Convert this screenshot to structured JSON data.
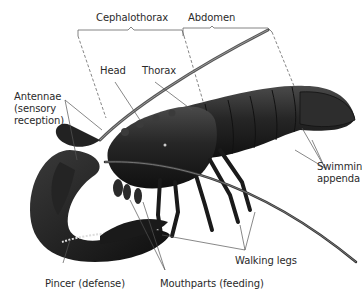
{
  "diagram": {
    "region_labels": {
      "cephalothorax": "Cephalothorax",
      "abdomen": "Abdomen"
    },
    "part_labels": {
      "head": "Head",
      "thorax": "Thorax",
      "antennae_line1": "Antennae",
      "antennae_line2": "(sensory",
      "antennae_line3": "reception)",
      "swimming_line1": "Swimmin",
      "swimming_line2": "appenda",
      "walking_legs": "Walking legs",
      "pincer": "Pincer (defense)",
      "mouthparts": "Mouthparts (feeding)"
    },
    "colors": {
      "background": "#ffffff",
      "body": "#1e1e1e",
      "label_text": "#2a2a2a",
      "leader_line": "#555555"
    }
  }
}
